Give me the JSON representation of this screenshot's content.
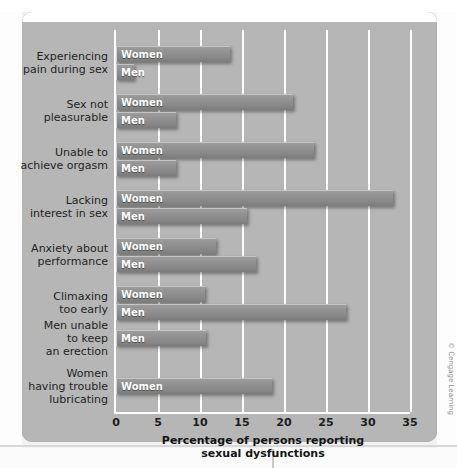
{
  "figure": {
    "credit": "© Cengage Learning"
  },
  "chart_data": {
    "type": "bar",
    "orientation": "horizontal",
    "title": "",
    "xlabel": "Percentage of persons reporting\nsexual dysfunctions",
    "ylabel": "",
    "xlim": [
      0,
      35
    ],
    "xticks": [
      0,
      5,
      10,
      15,
      20,
      25,
      30,
      35
    ],
    "xtick_labels": [
      "0",
      "5",
      "10",
      "15",
      "20",
      "25",
      "30",
      "35"
    ],
    "grid": true,
    "legend": "inline-bar-labels",
    "series_names": [
      "Women",
      "Men"
    ],
    "categories": [
      "Experiencing\npain during sex",
      "Sex not\npleasurable",
      "Unable to\nachieve orgasm",
      "Lacking\ninterest in sex",
      "Anxiety about\nperformance",
      "Climaxing\ntoo early",
      "Men unable\nto keep\nan erection",
      "Women\nhaving trouble\nlubricating"
    ],
    "groups": [
      {
        "category": "Experiencing\npain during sex",
        "bars": [
          {
            "series": "Women",
            "label": "Women",
            "value": 13.5
          },
          {
            "series": "Men",
            "label": "Men",
            "value": 2.0
          }
        ]
      },
      {
        "category": "Sex not\npleasurable",
        "bars": [
          {
            "series": "Women",
            "label": "Women",
            "value": 21.0
          },
          {
            "series": "Men",
            "label": "Men",
            "value": 7.0
          }
        ]
      },
      {
        "category": "Unable to\nachieve orgasm",
        "bars": [
          {
            "series": "Women",
            "label": "Women",
            "value": 23.5
          },
          {
            "series": "Men",
            "label": "Men",
            "value": 7.0
          }
        ]
      },
      {
        "category": "Lacking\ninterest in sex",
        "bars": [
          {
            "series": "Women",
            "label": "Women",
            "value": 32.8
          },
          {
            "series": "Men",
            "label": "Men",
            "value": 15.5
          }
        ]
      },
      {
        "category": "Anxiety about\nperformance",
        "bars": [
          {
            "series": "Women",
            "label": "Women",
            "value": 11.8
          },
          {
            "series": "Men",
            "label": "Men",
            "value": 16.6
          }
        ]
      },
      {
        "category": "Climaxing\ntoo early",
        "bars": [
          {
            "series": "Women",
            "label": "Women",
            "value": 10.5
          },
          {
            "series": "Men",
            "label": "Men",
            "value": 27.3
          }
        ]
      },
      {
        "category": "Men unable\nto keep\nan erection",
        "bars": [
          {
            "series": "Men",
            "label": "Men",
            "value": 10.6
          }
        ]
      },
      {
        "category": "Women\nhaving trouble\nlubricating",
        "bars": [
          {
            "series": "Women",
            "label": "Women",
            "value": 18.5
          }
        ]
      }
    ]
  }
}
